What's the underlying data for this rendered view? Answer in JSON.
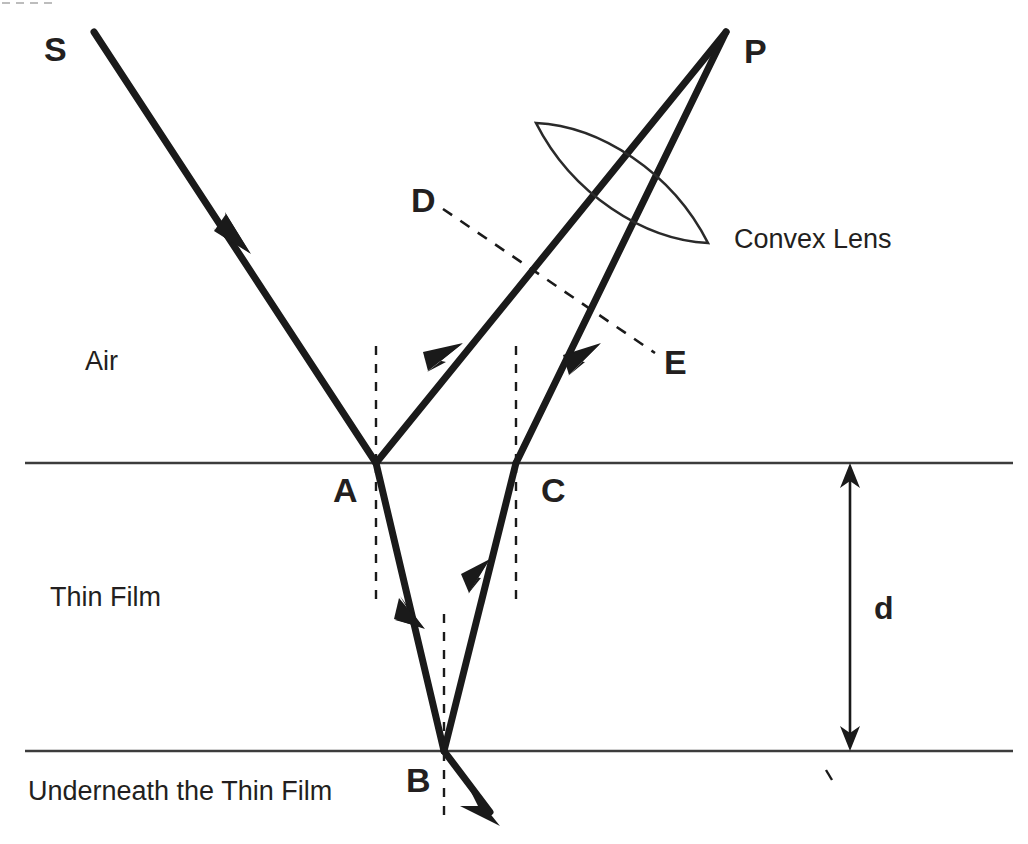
{
  "figure": {
    "background_color": "#ffffff",
    "ink_color": "#1a1a1a",
    "boundary_color": "#3c3c3c"
  },
  "points": {
    "source": "S",
    "top_incidence": "A",
    "bottom_reflection": "B",
    "top_exit": "C",
    "normal_upper": "D",
    "normal_lower": "E",
    "focus": "P"
  },
  "regions": {
    "above": "Air",
    "middle": "Thin Film",
    "below": "Underneath the Thin Film"
  },
  "annotations": {
    "lens": "Convex Lens",
    "thickness": "d"
  },
  "geometry": {
    "top_boundary_y": 463,
    "bottom_boundary_y": 751,
    "boundary_x_start": 25,
    "boundary_x_end": 1013,
    "point_a": [
      376,
      463
    ],
    "point_b": [
      444,
      751
    ],
    "point_c": [
      516,
      463
    ],
    "point_p": [
      726,
      32
    ],
    "source_start": [
      94,
      32
    ],
    "dim_arrow_x": 850,
    "lens_center": [
      622,
      183
    ]
  }
}
